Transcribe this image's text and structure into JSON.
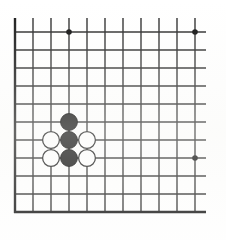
{
  "board": {
    "title": "Go board diagram",
    "game": "Go (Weiqi / Baduk)",
    "grid_columns": 11,
    "grid_rows": 11,
    "cell_size": 18,
    "origin_x": 15,
    "origin_y": 32,
    "line_color": "#2b2b2b",
    "border_color": "#1a1a1a",
    "background_color": "#ffffff",
    "line_width": 1.4,
    "border_width": 2.4,
    "board_note": "cropped corner section of a larger board"
  },
  "star_points": [
    {
      "name": "star-point-top-left",
      "col": 3,
      "row": 0,
      "radius": 2.8
    },
    {
      "name": "star-point-top-right",
      "col": 10,
      "row": 0,
      "radius": 2.8
    },
    {
      "name": "star-point-right",
      "col": 10,
      "row": 7,
      "radius": 2.8
    }
  ],
  "stones": [
    {
      "name": "black-stone-upper",
      "color": "black",
      "col": 3,
      "row": 5,
      "fill": "#111111",
      "stroke": "#000000",
      "radius": 8.4
    },
    {
      "name": "black-stone-center",
      "color": "black",
      "col": 3,
      "row": 6,
      "fill": "#111111",
      "stroke": "#000000",
      "radius": 8.4
    },
    {
      "name": "black-stone-lower",
      "color": "black",
      "col": 3,
      "row": 7,
      "fill": "#111111",
      "stroke": "#000000",
      "radius": 8.4
    },
    {
      "name": "white-stone-left-upper",
      "color": "white",
      "col": 2,
      "row": 6,
      "fill": "#ffffff",
      "stroke": "#1a1a1a",
      "radius": 8.4
    },
    {
      "name": "white-stone-right-upper",
      "color": "white",
      "col": 4,
      "row": 6,
      "fill": "#ffffff",
      "stroke": "#1a1a1a",
      "radius": 8.4
    },
    {
      "name": "white-stone-left-lower",
      "color": "white",
      "col": 2,
      "row": 7,
      "fill": "#ffffff",
      "stroke": "#1a1a1a",
      "radius": 8.4
    },
    {
      "name": "white-stone-right-lower",
      "color": "white",
      "col": 4,
      "row": 7,
      "fill": "#ffffff",
      "stroke": "#1a1a1a",
      "radius": 8.4
    }
  ],
  "counts": {
    "black_stones": 3,
    "white_stones": 4,
    "star_points": 3
  }
}
